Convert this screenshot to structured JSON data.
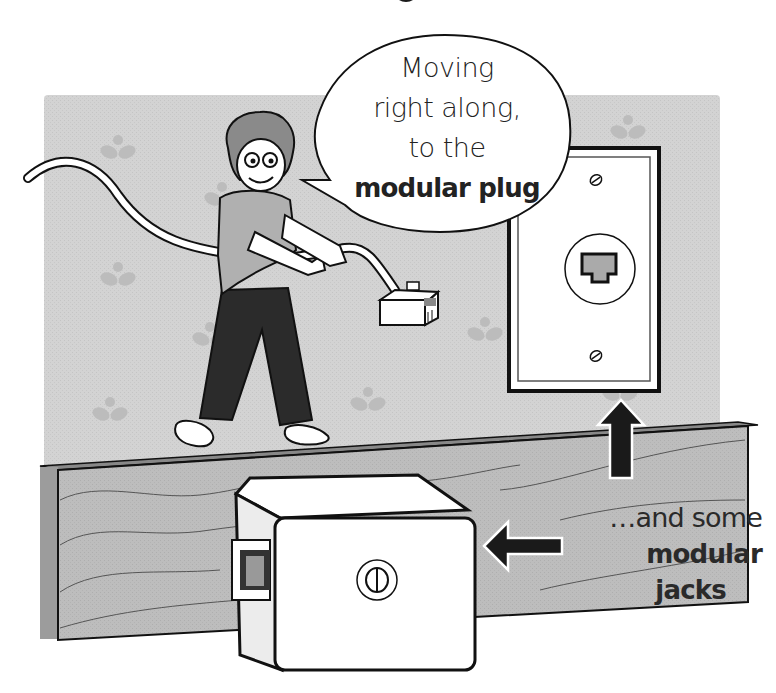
{
  "speech_bubble": {
    "lines": [
      "Moving",
      "right along,",
      "to the"
    ],
    "bold_line": "modular plug"
  },
  "caption": {
    "line1": "…and some",
    "bold_line1": "modular",
    "bold_line2": "jacks"
  },
  "colors": {
    "wall": "#d0d0d0",
    "wall_flowers": "#b9b9b9",
    "baseboard": "#b4b4b4",
    "baseboard_side": "#9c9c9c",
    "pants": "#2b2b2b",
    "hair": "#8a8a8a",
    "outline": "#111111",
    "white_parts": "#ffffff"
  },
  "elements": {
    "person": "cartoon person pulling phone cord",
    "plug": "modular-plug",
    "wall_plate": "wall-jack-plate",
    "surface_jack": "surface-mount-jack",
    "arrows": [
      "up-arrow",
      "left-arrow"
    ]
  }
}
